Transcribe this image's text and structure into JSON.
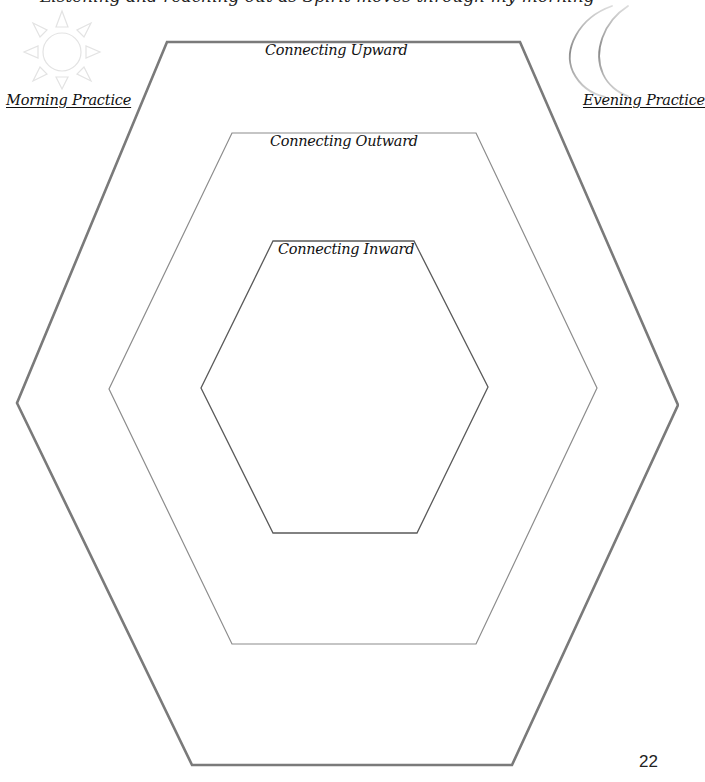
{
  "header": {
    "clipped_text": "Listening and reaching out as Spirit moves through my morning"
  },
  "icons": {
    "morning": "sun-icon",
    "evening": "crescent-moon-icon"
  },
  "labels": {
    "morning_practice": "Morning Practice",
    "evening_practice": "Evening Practice"
  },
  "hexagons": [
    {
      "name": "outer",
      "label": "Connecting Upward",
      "stroke": "#7a7a7a",
      "stroke_width": 2.6,
      "points": "167,42 520,42 678,405 512,765 192,765 17,403"
    },
    {
      "name": "middle",
      "label": "Connecting Outward",
      "stroke": "#8c8c8c",
      "stroke_width": 1.2,
      "points": "232,133 476,133 597,388 476,644 232,644 109,389"
    },
    {
      "name": "inner",
      "label": "Connecting Inward",
      "stroke": "#5a5a5a",
      "stroke_width": 1.3,
      "points": "273,241 414,241 488,387 417,533 273,533 201,388"
    }
  ],
  "page_number": "22"
}
